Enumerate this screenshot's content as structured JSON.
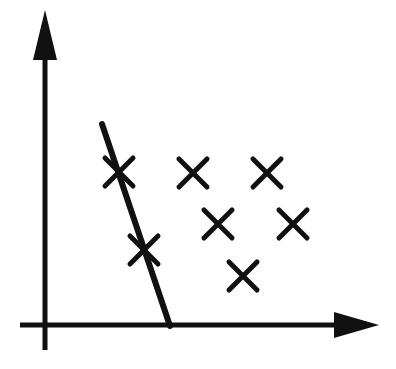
{
  "figure": {
    "canvas": {
      "width": 396,
      "height": 369,
      "background": "#ffffff"
    },
    "ink_color": "#111111",
    "axes": {
      "origin": {
        "x": 45,
        "y": 325
      },
      "x_axis": {
        "name": "horizontal axis",
        "start": {
          "x": 20,
          "y": 325
        },
        "end": {
          "x": 337,
          "y": 325
        },
        "stroke_width": 5,
        "arrow": {
          "name": "right arrowhead",
          "tip": {
            "x": 379,
            "y": 325
          },
          "base_x": 334,
          "half_height": 13
        },
        "tick_labels": [],
        "label": ""
      },
      "y_axis": {
        "name": "vertical axis",
        "start": {
          "x": 45,
          "y": 350
        },
        "end": {
          "x": 45,
          "y": 55
        },
        "stroke_width": 5,
        "arrow": {
          "name": "up arrowhead",
          "tip": {
            "x": 45,
            "y": 10
          },
          "base_y": 58,
          "half_width": 12
        },
        "tick_labels": [],
        "label": ""
      }
    },
    "boundary_line": {
      "name": "decision boundary",
      "from": {
        "x": 102,
        "y": 124
      },
      "to": {
        "x": 170,
        "y": 326
      },
      "stroke_width": 6
    },
    "markers": {
      "glyph": "x",
      "stroke_width": 5,
      "size": 28,
      "points": [
        {
          "id": "x1",
          "x": 119,
          "y": 172,
          "on_boundary": true
        },
        {
          "id": "x2",
          "x": 144,
          "y": 250,
          "on_boundary": true
        },
        {
          "id": "x3",
          "x": 193,
          "y": 173,
          "on_boundary": false
        },
        {
          "id": "x4",
          "x": 267,
          "y": 173,
          "on_boundary": false
        },
        {
          "id": "x5",
          "x": 218,
          "y": 224,
          "on_boundary": false
        },
        {
          "id": "x6",
          "x": 293,
          "y": 224,
          "on_boundary": false
        },
        {
          "id": "x7",
          "x": 243,
          "y": 276,
          "on_boundary": false
        }
      ]
    },
    "annotations": []
  },
  "chart_data": {
    "type": "scatter",
    "title": "",
    "xlabel": "",
    "ylabel": "",
    "grid": false,
    "legend": null,
    "axis_style": "arrow-terminated hand-drawn axes, no tick marks, no tick labels",
    "xlim": [
      0,
      10
    ],
    "ylim": [
      0,
      10
    ],
    "series": [
      {
        "name": "x-marked points",
        "marker": "x",
        "color": "#111111",
        "points": [
          {
            "x": 2.5,
            "y": 5.2
          },
          {
            "x": 3.4,
            "y": 2.6
          },
          {
            "x": 5.1,
            "y": 5.1
          },
          {
            "x": 7.6,
            "y": 5.1
          },
          {
            "x": 5.9,
            "y": 3.4
          },
          {
            "x": 8.4,
            "y": 3.4
          },
          {
            "x": 6.7,
            "y": 1.6
          }
        ]
      }
    ],
    "annotations": [
      {
        "type": "line",
        "name": "decision boundary",
        "from": {
          "x": 1.9,
          "y": 6.8
        },
        "to": {
          "x": 4.2,
          "y": 0.0
        }
      }
    ]
  }
}
